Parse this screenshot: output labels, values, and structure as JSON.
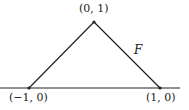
{
  "diagram": {
    "vertices": {
      "top": {
        "label": "(0, 1)",
        "x": 94,
        "y": 22
      },
      "left": {
        "label": "(−1, 0)",
        "x": 29,
        "y": 88
      },
      "right": {
        "label": "(1, 0)",
        "x": 160,
        "y": 88
      }
    },
    "edge_label": "F",
    "axis": {
      "x1": 0,
      "x2": 180,
      "y": 88
    },
    "colors": {
      "stroke": "#222222",
      "background": "#ffffff"
    }
  }
}
